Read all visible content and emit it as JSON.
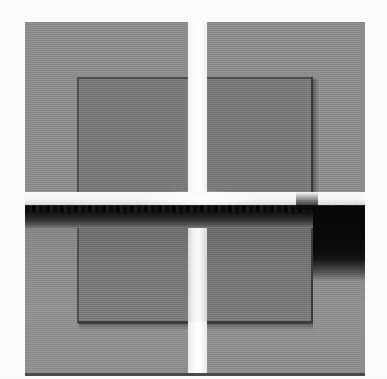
{
  "image": {
    "title": "Grayscale micrograph of a cleaved square sample",
    "modality": "grayscale-micrograph",
    "width_px": 387,
    "height_px": 379,
    "background_color": "#fbfbfb",
    "description": "Square sample with a concentric inner square, split by a bright vertical channel and a bright horizontal channel; a strong dark horizontal band runs across the lower-middle, with a large dark patch at the right."
  },
  "palette": {
    "paper_white": "#fbfbfb",
    "gap_white": "#fdfdfd",
    "outer_gray": "#8d8d8d",
    "inner_gray": "#7a7a7a",
    "inner_gray_lower": "#777777",
    "edge_dark": "#4e4e4e",
    "edge_dark_right": "#3a3a3a",
    "band_black": "#0e0e0e",
    "dark_patch": "#060606",
    "mid_gray": "#909090"
  },
  "regions": {
    "outer_blocks": [
      {
        "name": "top-left",
        "x": 25,
        "y": 22,
        "w": 163,
        "h": 170,
        "tone": "#8d8d8d"
      },
      {
        "name": "top-right",
        "x": 207,
        "y": 22,
        "w": 158,
        "h": 170,
        "tone": "#8d8d8d"
      },
      {
        "name": "bottom-left",
        "x": 25,
        "y": 207,
        "w": 163,
        "h": 167,
        "tone": "#8a8a8a"
      },
      {
        "name": "bottom-right",
        "x": 207,
        "y": 207,
        "w": 158,
        "h": 167,
        "tone": "#888888"
      }
    ],
    "inner_blocks": [
      {
        "name": "inner-top-left",
        "x": 78,
        "y": 78,
        "w": 110,
        "h": 114,
        "tone": "#7a7a7a"
      },
      {
        "name": "inner-top-right",
        "x": 207,
        "y": 78,
        "w": 106,
        "h": 114,
        "tone": "#7a7a7a"
      },
      {
        "name": "inner-bottom-left",
        "x": 78,
        "y": 228,
        "w": 110,
        "h": 94,
        "tone": "#797979"
      },
      {
        "name": "inner-bottom-right",
        "x": 207,
        "y": 228,
        "w": 106,
        "h": 94,
        "tone": "#777777"
      }
    ],
    "vertical_channel": {
      "x": 188,
      "w": 19,
      "from_y": 22,
      "to_y": 374,
      "tone": "#fdfdfd"
    },
    "bright_horizontal_band": {
      "x": 25,
      "y": 192,
      "w": 340,
      "h": 16,
      "tone": "#f6f6f6"
    },
    "dark_horizontal_band": {
      "x": 25,
      "y": 206,
      "w": 340,
      "h": 22,
      "tone": "#0e0e0e"
    },
    "dark_right_patch": {
      "x": 313,
      "y": 206,
      "w": 52,
      "h": 74,
      "tone": "#060606"
    }
  },
  "margins": {
    "left_px": 25,
    "right_px": 22,
    "top_px": 22,
    "bottom_px": 5
  }
}
